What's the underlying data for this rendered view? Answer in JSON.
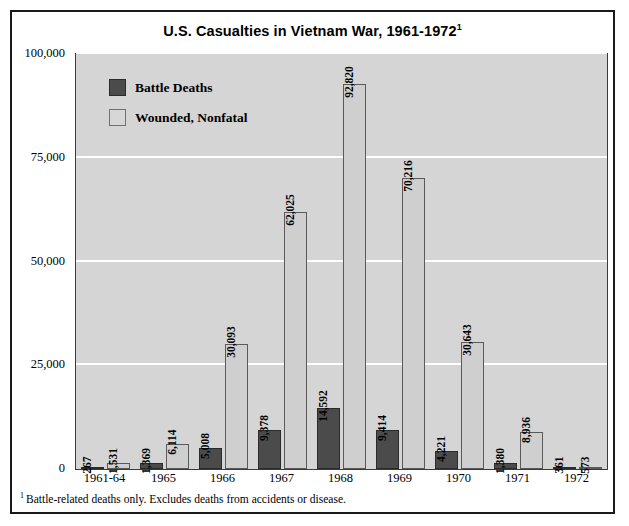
{
  "figure": {
    "title_main": "U.S. Casualties in Vietnam War, 1961-1972",
    "title_superscript": "1",
    "footnote_marker": "1",
    "footnote_text": "Battle-related deaths only. Excludes deaths from accidents or disease."
  },
  "legend": {
    "position": "inside-top-left",
    "items": [
      {
        "label": "Battle Deaths",
        "color": "#4b4b4b",
        "swatch": "deaths-swatch"
      },
      {
        "label": "Wounded, Nonfatal",
        "color": "#d7d7d7",
        "swatch": "wounded-swatch"
      }
    ]
  },
  "axes": {
    "y_ticks": [
      "0",
      "25,000",
      "50,000",
      "75,000",
      "100,000"
    ],
    "y_tick_values": [
      0,
      25000,
      50000,
      75000,
      100000
    ],
    "x_ticks": [
      "1961-64",
      "1965",
      "1966",
      "1967",
      "1968",
      "1969",
      "1970",
      "1971",
      "1972"
    ]
  },
  "chart_data": {
    "type": "bar",
    "title": "U.S. Casualties in Vietnam War, 1961-1972",
    "xlabel": "",
    "ylabel": "",
    "ylim": [
      0,
      100000
    ],
    "yticks": [
      0,
      25000,
      50000,
      75000,
      100000
    ],
    "ytick_labels": [
      "0",
      "25,000",
      "50,000",
      "75,000",
      "100,000"
    ],
    "grid": true,
    "grid_axis": "y",
    "grid_color": "#ffffff",
    "plot_background": "#d5d5d5",
    "legend_position": "upper left (inside plot)",
    "categories": [
      "1961-64",
      "1965",
      "1966",
      "1967",
      "1968",
      "1969",
      "1970",
      "1971",
      "1972"
    ],
    "series": [
      {
        "name": "Battle Deaths",
        "color": "#4b4b4b",
        "values": [
          267,
          1369,
          5008,
          9378,
          14592,
          9414,
          4221,
          1380,
          361
        ],
        "labels": [
          "267",
          "1,369",
          "5,008",
          "9,378",
          "14,592",
          "9,414",
          "4,221",
          "1,380",
          "361"
        ]
      },
      {
        "name": "Wounded, Nonfatal",
        "color": "#cfcfcf",
        "values": [
          1531,
          6114,
          30093,
          62025,
          92820,
          70216,
          30643,
          8936,
          573
        ],
        "labels": [
          "1,531",
          "6,114",
          "30,093",
          "62,025",
          "92,820",
          "70,216",
          "30,643",
          "8,936",
          "573"
        ]
      }
    ],
    "annotations": [
      "1 Battle-related deaths only. Excludes deaths from accidents or disease."
    ]
  }
}
